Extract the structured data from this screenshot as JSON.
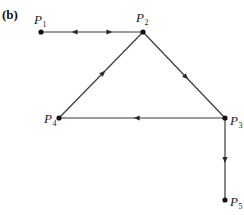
{
  "panel_label": "(b)",
  "nodes": [
    {
      "id": "P1",
      "letter": "P",
      "sub": "1"
    },
    {
      "id": "P2",
      "letter": "P",
      "sub": "2"
    },
    {
      "id": "P3",
      "letter": "P",
      "sub": "3"
    },
    {
      "id": "P4",
      "letter": "P",
      "sub": "4"
    },
    {
      "id": "P5",
      "letter": "P",
      "sub": "5"
    }
  ],
  "edges": [
    {
      "from": "P1",
      "to": "P2",
      "direction": "bidirectional"
    },
    {
      "from": "P2",
      "to": "P3",
      "direction": "forward"
    },
    {
      "from": "P3",
      "to": "P4",
      "direction": "forward"
    },
    {
      "from": "P4",
      "to": "P2",
      "direction": "forward"
    },
    {
      "from": "P3",
      "to": "P5",
      "direction": "forward"
    }
  ]
}
